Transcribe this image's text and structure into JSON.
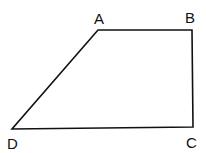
{
  "diagram": {
    "type": "quadrilateral",
    "stroke_color": "#111111",
    "vertices": [
      {
        "label": "A",
        "x": 98,
        "y": 30
      },
      {
        "label": "B",
        "x": 192,
        "y": 30
      },
      {
        "label": "C",
        "x": 193,
        "y": 127
      },
      {
        "label": "D",
        "x": 12,
        "y": 129
      }
    ],
    "labels": {
      "A": "A",
      "B": "B",
      "C": "C",
      "D": "D"
    }
  }
}
